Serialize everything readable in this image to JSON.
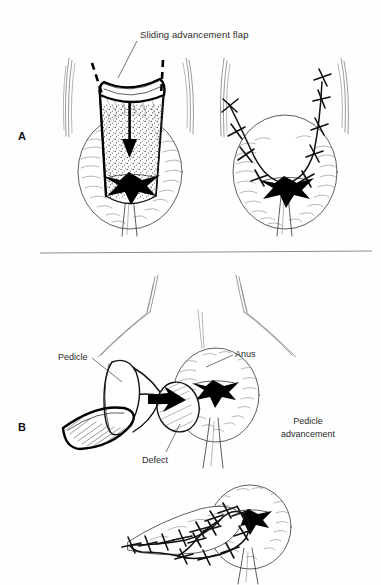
{
  "figure": {
    "background_color": "#fefefe",
    "ink_color": "#111111",
    "divider_color": "#8d8d8d"
  },
  "panels": [
    {
      "id": "panel-a",
      "letter": "A",
      "caption": "Sliding advancement flap",
      "annotations": [
        {
          "name": "sliding-advancement-flap",
          "text": "Sliding advancement flap",
          "x": 140,
          "y": 38,
          "anchor": "start"
        }
      ],
      "sub_figures": [
        {
          "name": "flap-raised",
          "description": "Anal canal with raised sliding advancement flap, dashed incision lines and downward advancement arrow"
        },
        {
          "name": "flap-sutured",
          "description": "Anal canal after flap advancement with U-shaped interrupted suture line"
        }
      ]
    },
    {
      "id": "panel-b",
      "letter": "B",
      "caption": "Pedicle advancement",
      "annotations": [
        {
          "name": "pedicle",
          "text": "Pedicle",
          "x": 58,
          "y": 360,
          "anchor": "start"
        },
        {
          "name": "anus",
          "text": "Anus",
          "x": 235,
          "y": 357,
          "anchor": "start"
        },
        {
          "name": "defect",
          "text": "Defect",
          "x": 142,
          "y": 463,
          "anchor": "start"
        },
        {
          "name": "pedicle-advancement",
          "text_line_1": "Pedicle",
          "text_line_2": "advancement",
          "x": 308,
          "y": 424,
          "anchor": "middle"
        }
      ],
      "sub_figures": [
        {
          "name": "pedicle-flap-raised",
          "description": "Island pedicle flap elevated beside anus showing defect"
        },
        {
          "name": "pedicle-flap-sutured",
          "description": "Pedicle flap inset and sutured into the anal defect"
        }
      ]
    }
  ],
  "divider": {
    "name": "panel-divider",
    "x1": 40,
    "y1": 253,
    "x2": 372,
    "y2": 251
  }
}
